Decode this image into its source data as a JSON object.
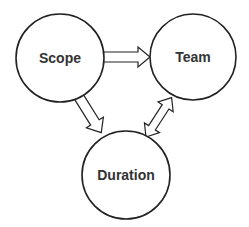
{
  "diagram": {
    "nodes": [
      {
        "id": "scope",
        "label": "Scope",
        "cx": 60,
        "cy": 58,
        "r": 44
      },
      {
        "id": "team",
        "label": "Team",
        "cx": 193,
        "cy": 57,
        "r": 43
      },
      {
        "id": "duration",
        "label": "Duration",
        "cx": 126,
        "cy": 175,
        "r": 44
      }
    ],
    "edges": [
      {
        "from": "scope",
        "to": "team",
        "type": "single-arrow"
      },
      {
        "from": "scope",
        "to": "duration",
        "type": "single-arrow"
      },
      {
        "from": "team",
        "to": "duration",
        "type": "double-arrow"
      }
    ],
    "colors": {
      "stroke": "#222222",
      "fill": "#ffffff",
      "text": "#333333"
    }
  }
}
